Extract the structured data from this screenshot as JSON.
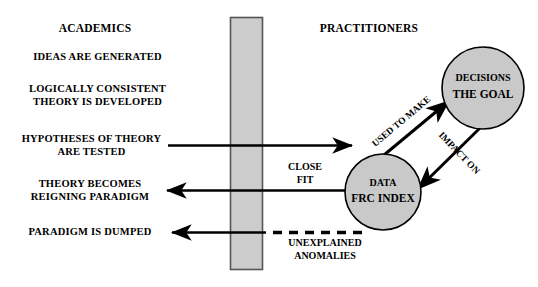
{
  "diagram": {
    "title_left": "ACADEMICS",
    "title_right": "PRACTITIONERS",
    "academics_steps": [
      "IDEAS ARE GENERATED",
      "LOGICALLY CONSISTENT\nTHEORY IS DEVELOPED",
      "HYPOTHESES OF THEORY\nARE TESTED",
      "THEORY BECOMES\nREIGNING PARADIGM",
      "PARADIGM IS DUMPED"
    ],
    "nodes": [
      {
        "id": "decisions",
        "line1": "DECISIONS",
        "line2": "THE GOAL",
        "fill": "#c9c9c9",
        "stroke": "#000000"
      },
      {
        "id": "data",
        "line1": "DATA",
        "line2": "FRC INDEX",
        "fill": "#c9c9c9",
        "stroke": "#000000"
      }
    ],
    "edge_labels": {
      "used_to_make": "USED TO MAKE",
      "impact_on": "IMPACT ON",
      "close_fit": "CLOSE\nFIT",
      "unexplained_anomalies": "UNEXPLAINED\nANOMALIES"
    },
    "divider": {
      "name": "vertical-gray-bar",
      "fill": "#cccccc",
      "stroke": "#555555"
    },
    "colors": {
      "background": "#ffffff",
      "ink": "#000000",
      "node_fill": "#c9c9c9",
      "bar_fill": "#cccccc"
    }
  }
}
